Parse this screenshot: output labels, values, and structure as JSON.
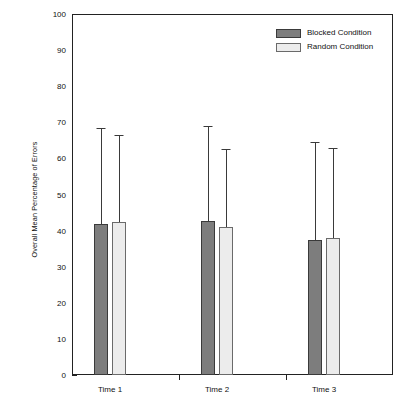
{
  "chart_data": {
    "type": "bar",
    "title": "",
    "xlabel": "",
    "ylabel": "Overall Mean Percentage of Errors",
    "ylim": [
      0,
      100
    ],
    "ytick_step": 10,
    "yminor_step": 5,
    "grid": false,
    "legend_position": "top-right",
    "categories": [
      "Time 1",
      "Time 2",
      "Time 3"
    ],
    "ytick_labels": [
      "0",
      "10",
      "20",
      "30",
      "40",
      "50",
      "60",
      "70",
      "80",
      "90",
      "100"
    ],
    "series": [
      {
        "name": "Blocked Condition",
        "color": "#7d7d7d",
        "values": [
          41.8,
          42.7,
          37.4
        ],
        "error_upper": [
          68.4,
          69.0,
          64.5
        ]
      },
      {
        "name": "Random Condition",
        "color": "#ececec",
        "values": [
          42.4,
          41.0,
          38.0
        ],
        "error_upper": [
          66.5,
          62.5,
          62.9
        ]
      }
    ]
  },
  "legend": {
    "items": [
      {
        "label": "Blocked Condition",
        "swatch": "blocked"
      },
      {
        "label": "Random Condition",
        "swatch": "random"
      }
    ]
  },
  "axes": {
    "y_title": "Overall Mean Percentage of Errors"
  }
}
